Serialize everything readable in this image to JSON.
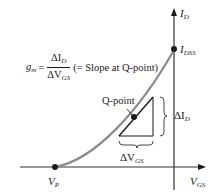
{
  "diagram": {
    "title_formula": {
      "lhs": "g",
      "lhs_sub": "m",
      "equals": "=",
      "numerator": "ΔI",
      "numerator_sub": "D",
      "denominator": "ΔV",
      "denominator_sub": "GS",
      "note": "(= Slope at Q-point)"
    },
    "axes": {
      "y_label": "I",
      "y_label_sub": "D",
      "x_label": "V",
      "x_label_sub": "GS"
    },
    "points": {
      "idss": {
        "label": "I",
        "sub": "DSS"
      },
      "vp": {
        "label": "V",
        "sub": "P"
      },
      "q": {
        "label": "Q-point"
      }
    },
    "deltas": {
      "delta_id": {
        "label": "ΔI",
        "sub": "D"
      },
      "delta_vgs": {
        "label": "ΔV",
        "sub": "GS"
      }
    },
    "colors": {
      "curve": "#8a8a8a",
      "axis": "#1a1a1a",
      "tangent": "#1a1a1a"
    }
  }
}
